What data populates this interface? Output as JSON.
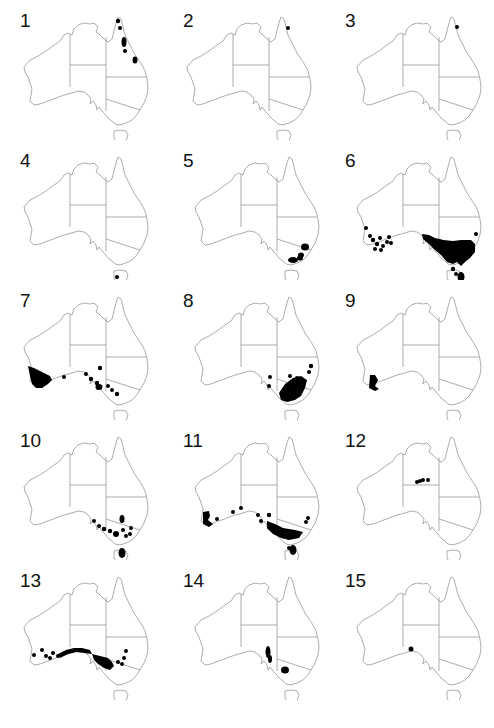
{
  "figure": {
    "colors": {
      "outline": "#8a8a8a",
      "dots": "#000000",
      "background": "#ffffff",
      "label": "#111111"
    },
    "panels": [
      {
        "label": "1",
        "region": "north-east Queensland coast (Cape York to Townsville)"
      },
      {
        "label": "2",
        "region": "Cape York tip, single record"
      },
      {
        "label": "3",
        "region": "Cape York, single record"
      },
      {
        "label": "4",
        "region": "southern Tasmania, single record"
      },
      {
        "label": "5",
        "region": "south-east NSW and eastern Victoria coast"
      },
      {
        "label": "6",
        "region": "south-west WA and south-east Australia incl. Tasmania"
      },
      {
        "label": "7",
        "region": "south-west WA, South Australia and western Victoria"
      },
      {
        "label": "8",
        "region": "south-east Australia (Victoria, NSW, SA)"
      },
      {
        "label": "9",
        "region": "south-west WA only"
      },
      {
        "label": "10",
        "region": "SA, Victoria and Tasmania"
      },
      {
        "label": "11",
        "region": "southern Australia incl. south-west WA and Tasmania"
      },
      {
        "label": "12",
        "region": "central Northern Territory"
      },
      {
        "label": "13",
        "region": "southern arid belt WA to NSW"
      },
      {
        "label": "14",
        "region": "South Australia and central Victoria"
      },
      {
        "label": "15",
        "region": "WA/SA border near Nullarbor, single record"
      }
    ]
  },
  "caption": {
    "text": ""
  }
}
